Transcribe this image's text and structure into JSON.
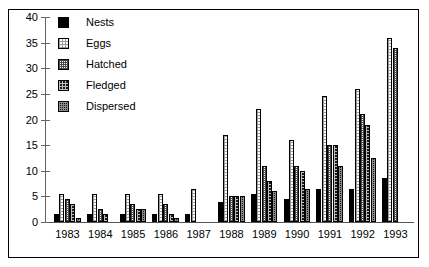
{
  "chart_data": {
    "type": "bar",
    "title": "",
    "subtitle": "",
    "xlabel": "",
    "ylabel": "",
    "categories": [
      "1983",
      "1984",
      "1985",
      "1986",
      "1987",
      "1988",
      "1989",
      "1990",
      "1991",
      "1992",
      "1993"
    ],
    "series": [
      {
        "name": "Nests",
        "values": [
          1.5,
          1.5,
          1.5,
          1.5,
          1.5,
          4.0,
          5.5,
          4.5,
          6.5,
          6.5,
          8.5
        ]
      },
      {
        "name": "Eggs",
        "values": [
          5.5,
          5.5,
          5.5,
          5.5,
          6.5,
          17.0,
          22.0,
          16.0,
          24.5,
          26.0,
          36.0
        ]
      },
      {
        "name": "Hatched",
        "values": [
          4.5,
          2.5,
          3.5,
          3.5,
          null,
          5.0,
          11.0,
          11.0,
          15.0,
          21.0,
          34.0
        ]
      },
      {
        "name": "Fledged",
        "values": [
          3.5,
          1.5,
          2.5,
          1.5,
          null,
          5.0,
          8.0,
          10.0,
          15.0,
          19.0,
          null
        ]
      },
      {
        "name": "Dispersed",
        "values": [
          0.8,
          null,
          2.5,
          0.8,
          null,
          5.0,
          6.0,
          6.5,
          11.0,
          12.5,
          null
        ]
      }
    ],
    "ylim": [
      0,
      40
    ],
    "yticks": [
      0,
      5,
      10,
      15,
      20,
      25,
      30,
      35,
      40
    ],
    "ytick_labels": [
      "0",
      "5",
      "10",
      "15",
      "20",
      "25",
      "30",
      "35",
      "40"
    ],
    "grid": false,
    "legend_position": "upper-left-inside",
    "legend": [
      {
        "label": "Nests",
        "pattern": "solid-black"
      },
      {
        "label": "Eggs",
        "pattern": "light-stipple"
      },
      {
        "label": "Hatched",
        "pattern": "medium-checker"
      },
      {
        "label": "Fledged",
        "pattern": "dark-checker"
      },
      {
        "label": "Dispersed",
        "pattern": "dark-dense-checker"
      }
    ],
    "colors": {
      "axis": "#666666",
      "text": "#000000",
      "background": "#ffffff",
      "border": "#000000"
    }
  }
}
